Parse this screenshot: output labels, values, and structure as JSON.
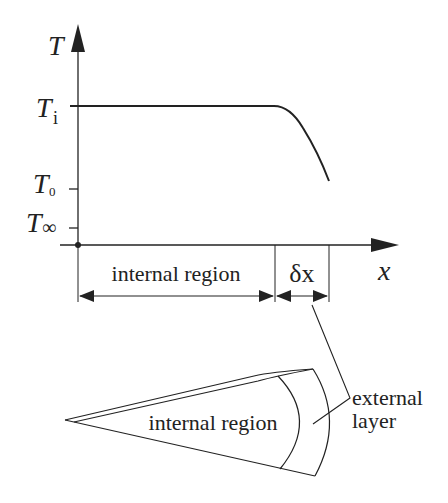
{
  "graph": {
    "y_axis_label": "T",
    "x_axis_label": "x",
    "ticks": {
      "Ti": {
        "main": "T",
        "sub": "i"
      },
      "T0": {
        "main": "T",
        "sub": "0"
      },
      "Tinf": {
        "main": "T",
        "sub": "∞"
      }
    },
    "dimension_internal_label": "internal region",
    "dimension_delta_label": "δx",
    "curve_description": "Temperature constant at T_i across internal region, dropping steeply within external layer δx"
  },
  "sketch": {
    "internal_label": "internal region",
    "external_label_line1": "external",
    "external_label_line2": "layer"
  },
  "colors": {
    "ink": "#222222",
    "background": "#ffffff"
  }
}
